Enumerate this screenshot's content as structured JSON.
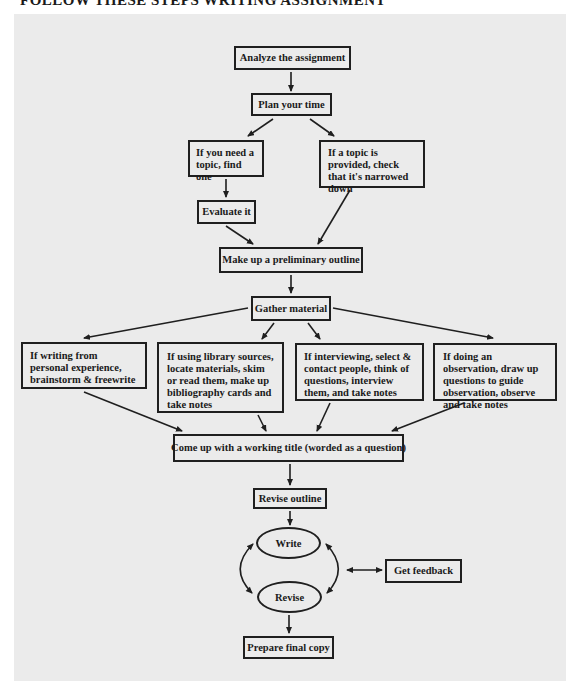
{
  "heading": "FOLLOW THESE STEPS WRITING ASSIGNMENT",
  "flowchart": {
    "analyze": "Analyze the assignment",
    "plan": "Plan your time",
    "need_topic": "If you need a topic, find one",
    "topic_provided": "If a topic is provided, check that it's narrowed down",
    "evaluate": "Evaluate it",
    "preliminary_outline": "Make up a preliminary outline",
    "gather": "Gather material",
    "personal": "If writing from personal experience, brainstorm & freewrite",
    "library": "If using library sources, locate materials, skim or read them, make up bibliography cards and take notes",
    "interview": "If interviewing, select & contact people, think of questions, interview them, and take notes",
    "observation": "If doing an observation, draw up questions to guide observation, observe and take notes",
    "working_title": "Come up with a working title (worded as a question)",
    "revise_outline": "Revise outline",
    "write": "Write",
    "revise": "Revise",
    "feedback": "Get feedback",
    "final_copy": "Prepare final copy"
  },
  "colors": {
    "panel": "#ebebeb",
    "ink": "#1f1f1f"
  }
}
